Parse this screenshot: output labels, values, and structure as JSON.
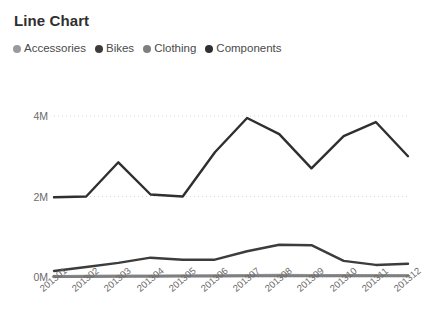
{
  "chart_data": {
    "type": "line",
    "title": "Line Chart",
    "xlabel": "",
    "ylabel": "",
    "grid": "horizontal-dotted",
    "legend_position": "top-left",
    "categories": [
      "201301",
      "201302",
      "201303",
      "201304",
      "201305",
      "201306",
      "201307",
      "201308",
      "201309",
      "201310",
      "201311",
      "201312"
    ],
    "ylim": [
      0,
      4400000
    ],
    "yticks": [
      0,
      2000000,
      4000000
    ],
    "ytick_labels": [
      "0M",
      "2M",
      "4M"
    ],
    "series": [
      {
        "name": "Accessories",
        "color": "#9a9a9a",
        "values": [
          20000,
          24000,
          28000,
          30000,
          33000,
          38000,
          44000,
          46000,
          42000,
          45000,
          43000,
          40000
        ]
      },
      {
        "name": "Bikes",
        "color": "#3c3c3c",
        "values": [
          150000,
          250000,
          350000,
          480000,
          430000,
          430000,
          640000,
          800000,
          790000,
          400000,
          300000,
          330000
        ]
      },
      {
        "name": "Clothing",
        "color": "#7f7f7f",
        "values": [
          8000,
          10000,
          13000,
          15000,
          17000,
          21000,
          26000,
          28000,
          25000,
          27000,
          26000,
          24000
        ]
      },
      {
        "name": "Components",
        "color": "#2f2f2f",
        "values": [
          1980000,
          2000000,
          2850000,
          2050000,
          2000000,
          3100000,
          3950000,
          3550000,
          2700000,
          3500000,
          3850000,
          3000000
        ]
      }
    ]
  },
  "legend": {
    "items": [
      {
        "label": "Accessories",
        "color": "#9a9a9a"
      },
      {
        "label": "Bikes",
        "color": "#3c3c3c"
      },
      {
        "label": "Clothing",
        "color": "#7f7f7f"
      },
      {
        "label": "Components",
        "color": "#2f2f2f"
      }
    ]
  },
  "axes": {
    "y_labels": [
      "4M",
      "2M",
      "0M"
    ],
    "x_labels": [
      "201301",
      "201302",
      "201303",
      "201304",
      "201305",
      "201306",
      "201307",
      "201308",
      "201309",
      "201310",
      "201311",
      "201312"
    ]
  },
  "colors": {
    "grid": "#d8d8d8",
    "axis_text": "#6b6b6b",
    "title_text": "#2f2f2f",
    "background": "#ffffff"
  }
}
